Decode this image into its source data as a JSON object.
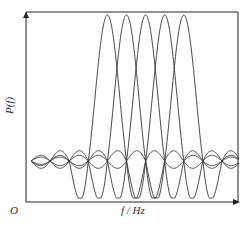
{
  "chart_data": {
    "type": "line",
    "title": "",
    "xlabel": "f / Hz",
    "ylabel": "P(f)",
    "origin_label": "O",
    "grid": false,
    "legend": null,
    "axis_ticks": "none",
    "series": [
      {
        "name": "subcarrier-1",
        "center_index": 4,
        "peak": 1.0
      },
      {
        "name": "subcarrier-2",
        "center_index": 5,
        "peak": 1.0
      },
      {
        "name": "subcarrier-3",
        "center_index": 6,
        "peak": 1.0
      },
      {
        "name": "subcarrier-4",
        "center_index": 7,
        "peak": 1.0
      },
      {
        "name": "subcarrier-5",
        "center_index": 8,
        "peak": 1.0
      }
    ],
    "x_nodes_count": 12,
    "function": "P(f) = sinc((f - f_k)/Δf)",
    "colors": {
      "line": "#333333",
      "axis": "#222222"
    }
  },
  "labels": {
    "ylabel": "P(f)",
    "xlabel": "f / Hz",
    "origin": "O"
  }
}
